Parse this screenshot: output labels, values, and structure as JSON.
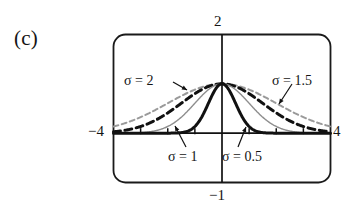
{
  "figure": {
    "panel_label": "(c)",
    "caption_absent": true
  },
  "axes": {
    "x_min_label": "−4",
    "x_max_label": "4",
    "y_min_label": "−1",
    "y_max_label": "2",
    "x_range": [
      -4,
      4
    ],
    "y_range": [
      -1,
      2
    ],
    "x_ticks": [
      -3,
      -2,
      -1,
      1,
      2,
      3
    ],
    "frame_color": "#1a1a1a",
    "axis_color": "#111111"
  },
  "annotations": {
    "sigma2": "σ = 2",
    "sigma15": "σ = 1.5",
    "sigma1": "σ = 1",
    "sigma05": "σ = 0.5"
  },
  "chart_data": {
    "type": "line",
    "title": "",
    "subtitle": "",
    "xlabel": "",
    "ylabel": "",
    "xlim": [
      -4,
      4
    ],
    "ylim": [
      -1,
      2
    ],
    "xticks": [
      -4,
      -3,
      -2,
      -1,
      0,
      1,
      2,
      3,
      4
    ],
    "xticklabels": [
      "−4",
      "",
      "",
      "",
      "",
      "",
      "",
      "",
      "4"
    ],
    "yticks": [
      -1,
      2
    ],
    "yticklabels": [
      "−1",
      "2"
    ],
    "grid": false,
    "legend": "inline-annotations",
    "x": [
      -4,
      -3.75,
      -3.5,
      -3.25,
      -3,
      -2.75,
      -2.5,
      -2.25,
      -2,
      -1.75,
      -1.5,
      -1.25,
      -1,
      -0.75,
      -0.5,
      -0.25,
      0,
      0.25,
      0.5,
      0.75,
      1,
      1.25,
      1.5,
      1.75,
      2,
      2.25,
      2.5,
      2.75,
      3,
      3.25,
      3.5,
      3.75,
      4
    ],
    "series": [
      {
        "name": "σ = 2",
        "sigma": 2,
        "style": "dashed",
        "color": "#9a9a9a",
        "width_px": 2,
        "peak": 1,
        "values": [
          0.135,
          0.174,
          0.217,
          0.264,
          0.325,
          0.387,
          0.458,
          0.531,
          0.607,
          0.682,
          0.755,
          0.822,
          0.882,
          0.93,
          0.969,
          0.992,
          1.0,
          0.992,
          0.969,
          0.93,
          0.882,
          0.822,
          0.755,
          0.682,
          0.607,
          0.531,
          0.458,
          0.387,
          0.325,
          0.264,
          0.217,
          0.174,
          0.135
        ]
      },
      {
        "name": "σ = 1.5",
        "sigma": 1.5,
        "style": "dashed",
        "color": "#111111",
        "width_px": 3,
        "peak": 1,
        "values": [
          0.028,
          0.044,
          0.066,
          0.095,
          0.135,
          0.185,
          0.249,
          0.325,
          0.411,
          0.503,
          0.607,
          0.707,
          0.801,
          0.882,
          0.946,
          0.986,
          1.0,
          0.986,
          0.946,
          0.882,
          0.801,
          0.707,
          0.607,
          0.503,
          0.411,
          0.325,
          0.249,
          0.185,
          0.135,
          0.095,
          0.066,
          0.044,
          0.028
        ]
      },
      {
        "name": "σ = 1",
        "sigma": 1,
        "style": "solid",
        "color": "#8e8e8e",
        "width_px": 1.4,
        "peak": 1,
        "values": [
          0.0003,
          0.0009,
          0.0022,
          0.0051,
          0.0111,
          0.0228,
          0.0439,
          0.0796,
          0.135,
          0.216,
          0.325,
          0.458,
          0.607,
          0.755,
          0.882,
          0.969,
          1.0,
          0.969,
          0.882,
          0.755,
          0.607,
          0.458,
          0.325,
          0.216,
          0.135,
          0.0796,
          0.0439,
          0.0228,
          0.0111,
          0.0051,
          0.0022,
          0.0009,
          0.0003
        ]
      },
      {
        "name": "σ = 0.5",
        "sigma": 0.5,
        "style": "solid",
        "color": "#111111",
        "width_px": 3,
        "peak": 1,
        "values": [
          0.0,
          0.0,
          0.0,
          0.0,
          0.0001,
          0.0001,
          0.0001,
          0.0001,
          0.0003,
          0.0022,
          0.0111,
          0.0439,
          0.135,
          0.325,
          0.607,
          0.882,
          1.0,
          0.882,
          0.607,
          0.325,
          0.135,
          0.0439,
          0.0111,
          0.0022,
          0.0003,
          0.0001,
          0.0001,
          0.0001,
          0.0001,
          0.0,
          0.0,
          0.0,
          0.0
        ]
      }
    ]
  }
}
